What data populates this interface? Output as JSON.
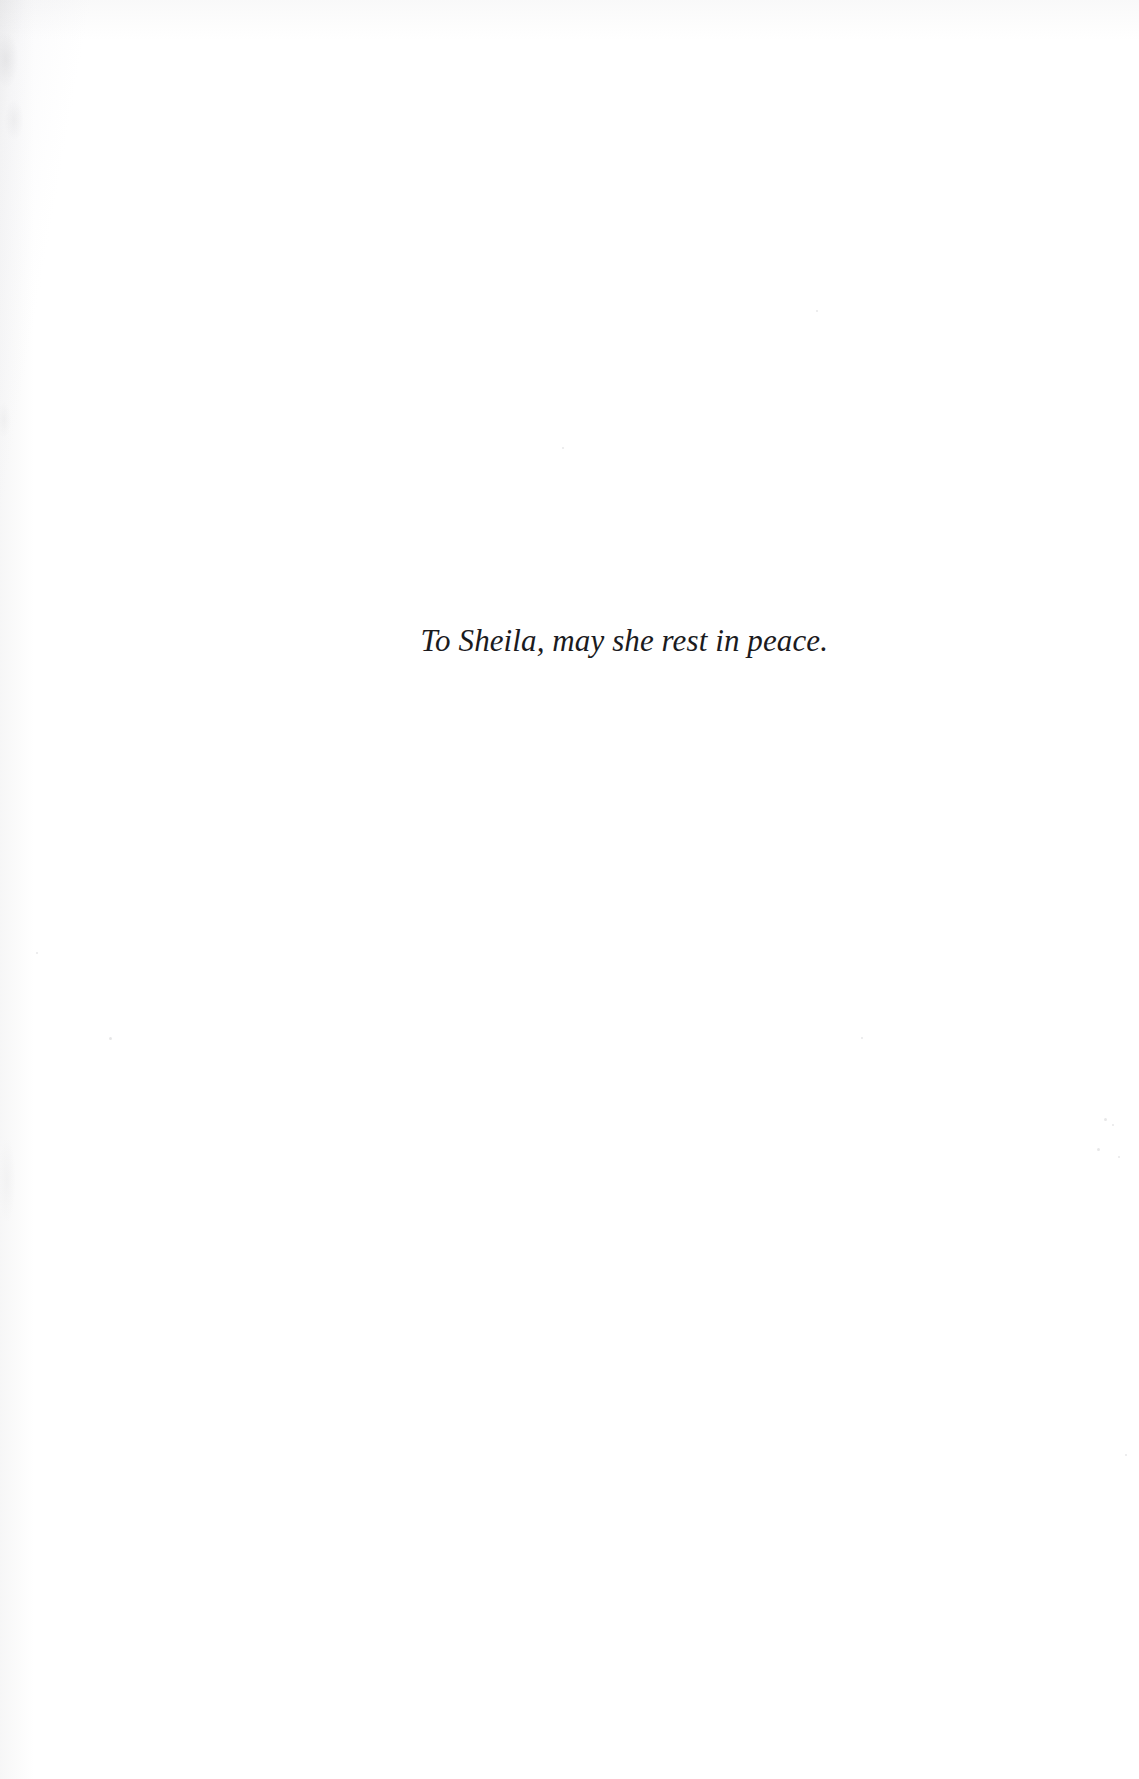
{
  "document": {
    "type": "book-dedication-page",
    "page_background_color": "#ffffff",
    "text_color": "#1b1b1e",
    "dedication": {
      "text": "To Sheila, may she rest in peace.",
      "style": "italic-serif",
      "alignment": "centered-slightly-right"
    },
    "marks": {
      "specks": [
        {
          "x": 1104,
          "y": 1118,
          "size": 3
        },
        {
          "x": 1112,
          "y": 1124,
          "size": 2
        },
        {
          "x": 1097,
          "y": 1148,
          "size": 3
        },
        {
          "x": 1118,
          "y": 1156,
          "size": 2
        },
        {
          "x": 36,
          "y": 952,
          "size": 2
        },
        {
          "x": 109,
          "y": 1037,
          "size": 3
        },
        {
          "x": 861,
          "y": 1037,
          "size": 2
        },
        {
          "x": 816,
          "y": 310,
          "size": 2
        },
        {
          "x": 562,
          "y": 447,
          "size": 2
        },
        {
          "x": 1125,
          "y": 1454,
          "size": 2
        }
      ]
    }
  }
}
